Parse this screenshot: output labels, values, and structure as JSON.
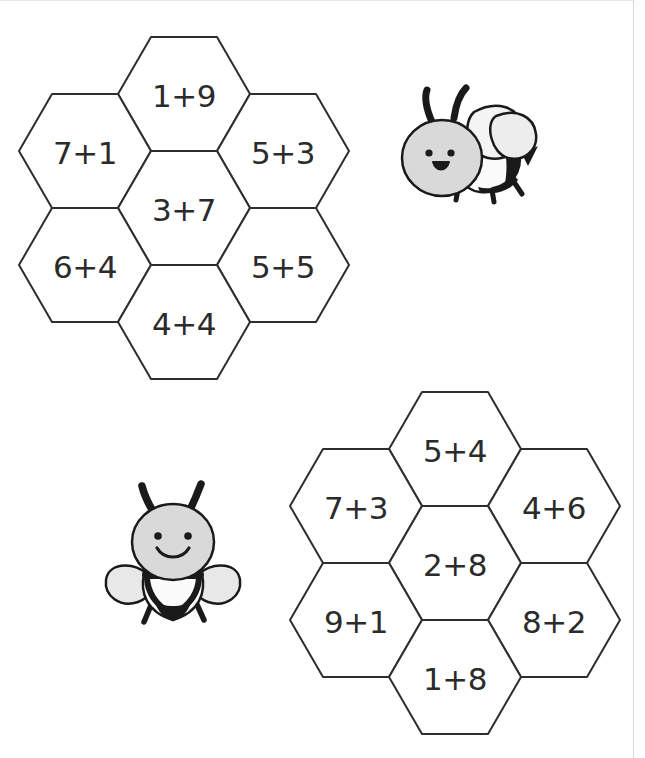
{
  "page": {
    "background_color": "#ffffff",
    "ink_color": "#2e2e2e",
    "width": 645,
    "height": 758
  },
  "honeycombs": [
    {
      "name": "honeycomb-top-left",
      "cells": [
        {
          "position": "top-center",
          "label": "1+9"
        },
        {
          "position": "left-upper",
          "label": "7+1"
        },
        {
          "position": "right-upper",
          "label": "5+3"
        },
        {
          "position": "center",
          "label": "3+7"
        },
        {
          "position": "left-lower",
          "label": "6+4"
        },
        {
          "position": "right-lower",
          "label": "5+5"
        },
        {
          "position": "bottom-center",
          "label": "4+4"
        }
      ]
    },
    {
      "name": "honeycomb-bottom-right",
      "cells": [
        {
          "position": "top-center",
          "label": "5+4"
        },
        {
          "position": "left-upper",
          "label": "7+3"
        },
        {
          "position": "right-upper",
          "label": "4+6"
        },
        {
          "position": "center",
          "label": "2+8"
        },
        {
          "position": "left-lower",
          "label": "9+1"
        },
        {
          "position": "right-lower",
          "label": "8+2"
        },
        {
          "position": "bottom-center",
          "label": "1+8"
        }
      ]
    }
  ],
  "bees": [
    {
      "name": "bee-flying-side",
      "view": "side",
      "expression": "open-mouth",
      "body_color": "#d9d9d9",
      "stripe_color": "#1a1a1a",
      "wing_color": "#f2f2f2"
    },
    {
      "name": "bee-front-smiling",
      "view": "front",
      "expression": "smile",
      "body_color": "#d9d9d9",
      "stripe_color": "#1a1a1a",
      "wing_color": "#e8e8e8"
    }
  ]
}
